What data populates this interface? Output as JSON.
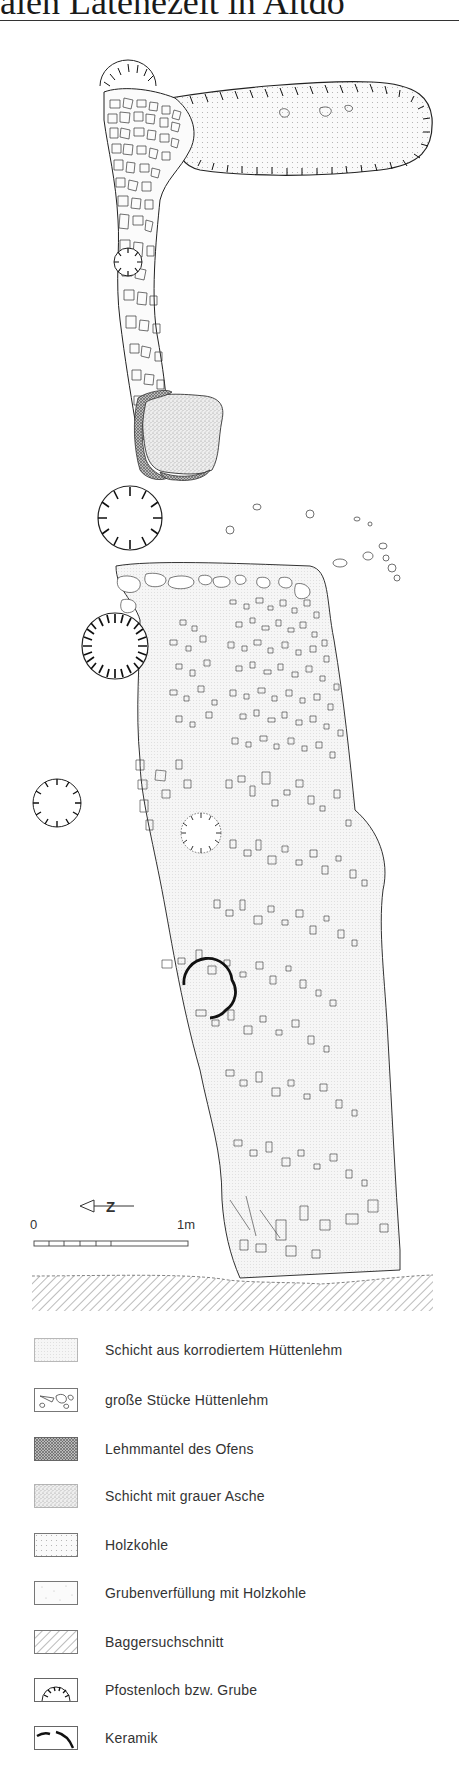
{
  "header": {
    "title_fragment": "alen Latènezeit in Altdo"
  },
  "plan": {
    "north_arrow_label": "Z",
    "scale": {
      "start_label": "0",
      "end_label": "1m",
      "divisions": 6
    }
  },
  "legend": {
    "items": [
      {
        "id": "huettenlehm-layer",
        "label": "Schicht aus korrodiertem Hüttenlehm",
        "pattern": "fine-dot"
      },
      {
        "id": "huettenlehm-pieces",
        "label": "große Stücke Hüttenlehm",
        "pattern": "outlined-pieces"
      },
      {
        "id": "ofen-lehmmantel",
        "label": "Lehmmantel des Ofens",
        "pattern": "dense-crosshatch"
      },
      {
        "id": "asche-layer",
        "label": "Schicht mit grauer Asche",
        "pattern": "stipple"
      },
      {
        "id": "holzkohle",
        "label": "Holzkohle",
        "pattern": "sparse-dot"
      },
      {
        "id": "grubenverfuellung",
        "label": "Grubenverfüllung mit Holzkohle",
        "pattern": "very-sparse-dot"
      },
      {
        "id": "baggersuchschnitt",
        "label": "Baggersuchschnitt",
        "pattern": "diagonal-hatch"
      },
      {
        "id": "pfostenloch",
        "label": "Pfostenloch bzw. Grube",
        "pattern": "hachured-semicircle"
      },
      {
        "id": "keramik",
        "label": "Keramik",
        "pattern": "thick-arc"
      }
    ]
  },
  "colors": {
    "ink": "#222222",
    "paper": "#ffffff",
    "fill_light": "#f2f2f2",
    "ash": "#d9d9d9",
    "lehmmantel": "#9a9a9a"
  }
}
